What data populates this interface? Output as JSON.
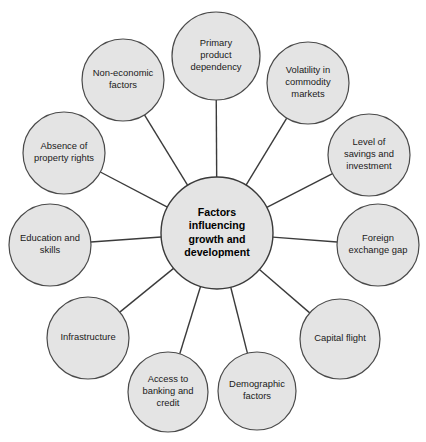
{
  "diagram": {
    "type": "radial-hub-and-spoke",
    "colors": {
      "node_fill": "#e4e4e4",
      "node_stroke": "#4a4a4a",
      "line": "#3b3b3b",
      "text": "#1a1a1a",
      "background": "#ffffff"
    },
    "hub": {
      "label": "Factors influencing growth and development",
      "lines": [
        "Factors",
        "influencing",
        "growth and",
        "development"
      ],
      "cx": 217,
      "cy": 233,
      "r": 56
    },
    "nodes": [
      {
        "id": "primary-product-dependency",
        "label": "Primary product dependency",
        "lines": [
          "Primary",
          "product",
          "dependency"
        ],
        "cx": 216,
        "cy": 56,
        "r": 44
      },
      {
        "id": "volatility-in-commodity-markets",
        "label": "Volatility in commodity markets",
        "lines": [
          "Volatility in",
          "commodity",
          "markets"
        ],
        "cx": 308,
        "cy": 83,
        "r": 41
      },
      {
        "id": "level-of-savings-and-investment",
        "label": "Level of savings and investment",
        "lines": [
          "Level of",
          "savings and",
          "investment"
        ],
        "cx": 369,
        "cy": 155,
        "r": 41
      },
      {
        "id": "foreign-exchange-gap",
        "label": "Foreign exchange gap",
        "lines": [
          "Foreign",
          "exchange gap"
        ],
        "cx": 378,
        "cy": 245,
        "r": 41
      },
      {
        "id": "capital-flight",
        "label": "Capital flight",
        "lines": [
          "Capital flight"
        ],
        "cx": 340,
        "cy": 339,
        "r": 40
      },
      {
        "id": "demographic-factors",
        "label": "Demographic factors",
        "lines": [
          "Demographic",
          "factors"
        ],
        "cx": 257,
        "cy": 391,
        "r": 39
      },
      {
        "id": "access-to-banking-and-credit",
        "label": "Access to banking and credit",
        "lines": [
          "Access to",
          "banking and",
          "credit"
        ],
        "cx": 168,
        "cy": 392,
        "r": 40
      },
      {
        "id": "infrastructure",
        "label": "Infrastructure",
        "lines": [
          "Infrastructure"
        ],
        "cx": 88,
        "cy": 338,
        "r": 41
      },
      {
        "id": "education-and-skills",
        "label": "Education and skills",
        "lines": [
          "Education and",
          "skills"
        ],
        "cx": 50,
        "cy": 245,
        "r": 41
      },
      {
        "id": "absence-of-property-rights",
        "label": "Absence of property rights",
        "lines": [
          "Absence of",
          "property rights"
        ],
        "cx": 64,
        "cy": 153,
        "r": 41
      },
      {
        "id": "non-economic-factors",
        "label": "Non-economic factors",
        "lines": [
          "Non-economic",
          "factors"
        ],
        "cx": 123,
        "cy": 80,
        "r": 41
      }
    ]
  }
}
